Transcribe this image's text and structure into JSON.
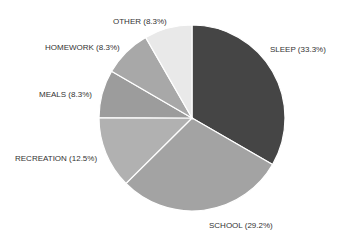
{
  "chart_data": {
    "type": "pie",
    "title": "",
    "start_angle_deg": 0,
    "direction": "clockwise",
    "slices": [
      {
        "label": "SLEEP",
        "value": 33.3,
        "display": "SLEEP (33.3%)",
        "color": "#454545"
      },
      {
        "label": "SCHOOL",
        "value": 29.2,
        "display": "SCHOOL (29.2%)",
        "color": "#a3a3a3"
      },
      {
        "label": "RECREATION",
        "value": 12.5,
        "display": "RECREATION (12.5%)",
        "color": "#b1b1b1"
      },
      {
        "label": "MEALS",
        "value": 8.3,
        "display": "MEALS (8.3%)",
        "color": "#9c9c9c"
      },
      {
        "label": "HOMEWORK",
        "value": 8.3,
        "display": "HOMEWORK (8.3%)",
        "color": "#a8a8a8"
      },
      {
        "label": "OTHER",
        "value": 8.3,
        "display": "OTHER (8.3%)",
        "color": "#e9e9e9"
      }
    ],
    "categories": [
      "SLEEP",
      "SCHOOL",
      "RECREATION",
      "MEALS",
      "HOMEWORK",
      "OTHER"
    ],
    "values": [
      33.3,
      29.2,
      12.5,
      8.3,
      8.3,
      8.3
    ],
    "legend": "none (labels placed outside slices)"
  },
  "layout": {
    "cx": 192,
    "cy": 118,
    "r": 93,
    "labels": [
      {
        "x": 270,
        "y": 52,
        "anchor": "start"
      },
      {
        "x": 209,
        "y": 228,
        "anchor": "start"
      },
      {
        "x": 15,
        "y": 161,
        "anchor": "start"
      },
      {
        "x": 39,
        "y": 97,
        "anchor": "start"
      },
      {
        "x": 45,
        "y": 50,
        "anchor": "start"
      },
      {
        "x": 113,
        "y": 24,
        "anchor": "start"
      }
    ]
  }
}
